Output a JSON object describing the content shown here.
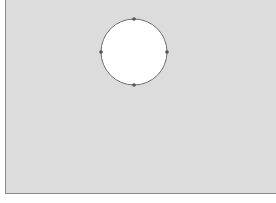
{
  "canvas": {
    "fill": "#dcdcdc",
    "border": "#8c8c8c"
  },
  "shape": {
    "type": "circle",
    "cx": 134,
    "cy": 52,
    "r": 33,
    "fill": "#ffffff",
    "stroke": "#6e6e6e",
    "handles": [
      {
        "name": "top",
        "x": 134,
        "y": 19
      },
      {
        "name": "right",
        "x": 167,
        "y": 52
      },
      {
        "name": "bottom",
        "x": 134,
        "y": 85
      },
      {
        "name": "left",
        "x": 101,
        "y": 52
      }
    ],
    "handle_color": "#555555"
  }
}
